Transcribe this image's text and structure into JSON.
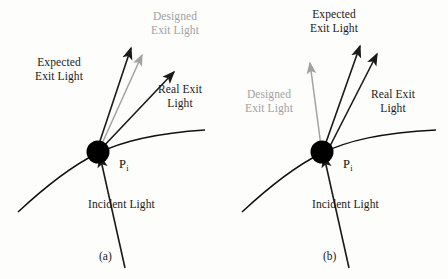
{
  "figure": {
    "width": 448,
    "height": 279,
    "background": "#fdfdfc",
    "colors": {
      "ink": "#1a1a1a",
      "designed_grey": "#a2a2a2",
      "curve": "#111111",
      "point": "#000000"
    }
  },
  "panels": [
    {
      "id": "a",
      "caption": "(a)",
      "point_label": "P",
      "point_subscript": "i",
      "labels": {
        "expected": {
          "line1": "Expected",
          "line2": "Exit Light",
          "color": "#1a1a1a"
        },
        "designed": {
          "line1": "Designed",
          "line2": "Exit Light",
          "color": "#a2a2a2"
        },
        "real": {
          "line1": "Real Exit",
          "line2": "Light",
          "color": "#1a1a1a"
        },
        "incident": {
          "line1": "Incident Light",
          "color": "#1a1a1a"
        }
      }
    },
    {
      "id": "b",
      "caption": "(b)",
      "point_label": "P",
      "point_subscript": "i",
      "labels": {
        "expected": {
          "line1": "Expected",
          "line2": "Exit Light",
          "color": "#1a1a1a"
        },
        "designed": {
          "line1": "Designed",
          "line2": "Exit Light",
          "color": "#a2a2a2"
        },
        "real": {
          "line1": "Real Exit",
          "line2": "Light",
          "color": "#1a1a1a"
        },
        "incident": {
          "line1": "Incident Light",
          "color": "#1a1a1a"
        }
      }
    }
  ]
}
